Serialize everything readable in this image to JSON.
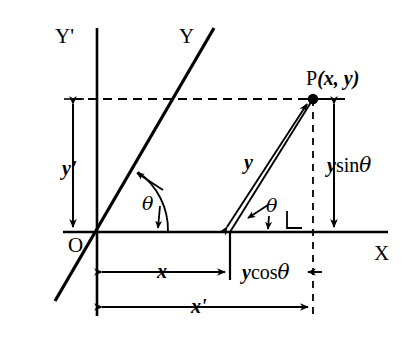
{
  "figure": {
    "type": "geometry-diagram",
    "background_color": "#ffffff",
    "stroke_color": "#000000"
  },
  "axes": {
    "x_axis_label": "X",
    "y_prime_axis_label": "Y'",
    "y_axis_label": "Y",
    "origin_label": "O"
  },
  "point": {
    "label": "P(x, y)",
    "name": "P",
    "coordinates_text": "(x, y)"
  },
  "measures": {
    "y_prime": "y'",
    "x": "x",
    "x_prime": "x'",
    "y": "y",
    "y_sin_theta": "ysinθ",
    "y_cos_theta": "ycosθ"
  },
  "angles": {
    "theta_at_origin": "θ",
    "theta_at_foot": "θ"
  },
  "geometry": {
    "origin": [
      97,
      232
    ],
    "point_p": [
      313,
      99
    ],
    "x_axis_start": [
      63,
      232
    ],
    "x_axis_end": [
      388,
      232
    ],
    "y_prime_axis_top": [
      97,
      28
    ],
    "y_prime_axis_bottom": [
      97,
      316
    ],
    "oblique_line_top": [
      214,
      28
    ],
    "oblique_line_bottom": [
      55,
      301
    ],
    "foot_of_y": [
      230,
      232
    ],
    "dashed_horizontal_y": 99,
    "dashed_vertical_x": 313
  }
}
